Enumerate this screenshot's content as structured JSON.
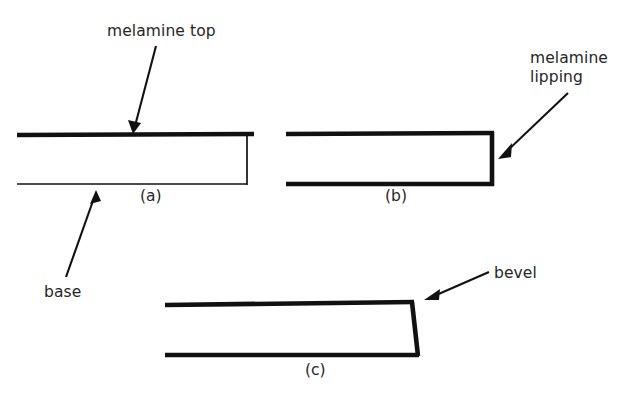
{
  "figure": {
    "background_color": "#ffffff",
    "ink_color": "#111111",
    "panels": [
      {
        "id": "a",
        "caption": "(a)",
        "description": "melamine top on base, square unfinished edge",
        "caption_x": 140,
        "caption_y": 201,
        "top_line": {
          "x1": 17,
          "y1": 135,
          "x2": 254,
          "y2": 134,
          "weight": "thick"
        },
        "bottom_line": {
          "x1": 17,
          "y1": 184,
          "x2": 247,
          "y2": 184,
          "weight": "thin"
        },
        "right_edge": {
          "x1": 247,
          "y1": 136,
          "x2": 247,
          "y2": 185,
          "weight": "thin"
        }
      },
      {
        "id": "b",
        "caption": "(b)",
        "description": "melamine top with melamine lipping on the edge",
        "caption_x": 385,
        "caption_y": 201,
        "top_line": {
          "x1": 286,
          "y1": 134,
          "x2": 494,
          "y2": 133,
          "weight": "thick"
        },
        "bottom_line": {
          "x1": 286,
          "y1": 184,
          "x2": 494,
          "y2": 184,
          "weight": "thick"
        },
        "right_edge": {
          "x1": 492,
          "y1": 133,
          "x2": 492,
          "y2": 186,
          "weight": "thick"
        }
      },
      {
        "id": "c",
        "caption": "(c)",
        "description": "melamine top with bevelled edge",
        "caption_x": 305,
        "caption_y": 375,
        "top_line": {
          "x1": 165,
          "y1": 305,
          "x2": 413,
          "y2": 302,
          "weight": "thick"
        },
        "bottom_line": {
          "x1": 165,
          "y1": 355,
          "x2": 419,
          "y2": 355,
          "weight": "thick"
        },
        "right_edge": {
          "x1": 412,
          "y1": 302,
          "x2": 418,
          "y2": 356,
          "weight": "thick"
        }
      }
    ],
    "annotations": [
      {
        "name": "melamine-top",
        "text": "melamine top",
        "lines": [
          "melamine top"
        ],
        "text_x": 107,
        "text_y": 36,
        "leader": {
          "x1": 156,
          "y1": 46,
          "x2": 134,
          "y2": 129
        },
        "arrow_at": "end",
        "points_to": "panel-a-top-surface"
      },
      {
        "name": "melamine-lipping",
        "text": "melamine lipping",
        "lines": [
          "melamine",
          "lipping"
        ],
        "text_x": 530,
        "text_y": 63,
        "leader": {
          "x1": 568,
          "y1": 93,
          "x2": 500,
          "y2": 156
        },
        "arrow_at": "end",
        "points_to": "panel-b-right-edge"
      },
      {
        "name": "base",
        "text": "base",
        "lines": [
          "base"
        ],
        "text_x": 44,
        "text_y": 297,
        "leader": {
          "x1": 66,
          "y1": 277,
          "x2": 95,
          "y2": 192
        },
        "arrow_at": "end",
        "points_to": "panel-a-base-underside"
      },
      {
        "name": "bevel",
        "text": "bevel",
        "lines": [
          "bevel"
        ],
        "text_x": 494,
        "text_y": 278,
        "leader": {
          "x1": 489,
          "y1": 272,
          "x2": 428,
          "y2": 298
        },
        "arrow_at": "end",
        "points_to": "panel-c-bevelled-edge"
      }
    ]
  }
}
